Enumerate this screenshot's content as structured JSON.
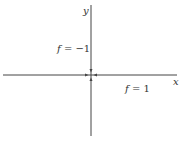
{
  "diagram": {
    "axes": {
      "x_label": "x",
      "y_label": "y"
    },
    "regions": [
      {
        "label_var": "f",
        "label_eq": " = ",
        "label_val": "−1",
        "position": "upper-left"
      },
      {
        "label_var": "f",
        "label_eq": " = ",
        "label_val": "1",
        "position": "lower-right"
      }
    ],
    "origin_marker": "arrows-converging-to-origin",
    "colors": {
      "axis": "#444444",
      "text": "#333333",
      "background": "#ffffff"
    }
  }
}
